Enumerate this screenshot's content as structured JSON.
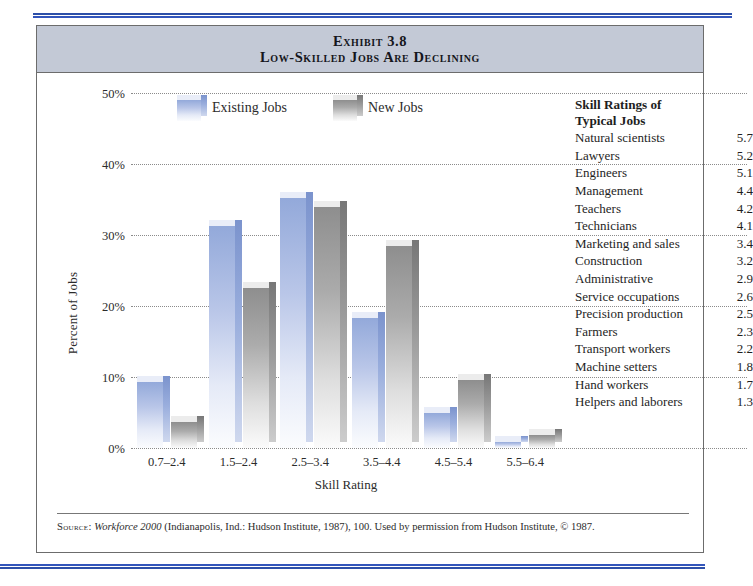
{
  "exhibit": {
    "title_line1": "Exhibit 3.8",
    "title_line2": "Low-Skilled Jobs Are Declining",
    "source_prefix": "Source:",
    "source_italic": "Workforce 2000",
    "source_rest": "(Indianapolis, Ind.: Hudson Institute, 1987), 100. Used by permission from Hudson Institute, © 1987."
  },
  "legend": {
    "existing_label": "Existing Jobs",
    "new_label": "New Jobs",
    "existing_color": "#9aaedd",
    "new_color": "#9a9a9a"
  },
  "ratings": {
    "heading_line1": "Skill Ratings of",
    "heading_line2": "Typical Jobs",
    "rows": [
      {
        "job": "Natural scientists",
        "rating": "5.7"
      },
      {
        "job": "Lawyers",
        "rating": "5.2"
      },
      {
        "job": "Engineers",
        "rating": "5.1"
      },
      {
        "job": "Management",
        "rating": "4.4"
      },
      {
        "job": "Teachers",
        "rating": "4.2"
      },
      {
        "job": "Technicians",
        "rating": "4.1"
      },
      {
        "job": "Marketing and sales",
        "rating": "3.4"
      },
      {
        "job": "Construction",
        "rating": "3.2"
      },
      {
        "job": "Administrative",
        "rating": "2.9"
      },
      {
        "job": "Service occupations",
        "rating": "2.6"
      },
      {
        "job": "Precision production",
        "rating": "2.5"
      },
      {
        "job": "Farmers",
        "rating": "2.3"
      },
      {
        "job": "Transport workers",
        "rating": "2.2"
      },
      {
        "job": "Machine setters",
        "rating": "1.8"
      },
      {
        "job": "Hand workers",
        "rating": "1.7"
      },
      {
        "job": "Helpers and laborers",
        "rating": "1.3"
      }
    ]
  },
  "chart_data": {
    "type": "bar",
    "title": "Low-Skilled Jobs Are Declining",
    "xlabel": "Skill Rating",
    "ylabel": "Percent of Jobs",
    "categories": [
      "0.7–2.4",
      "1.5–2.4",
      "2.5–3.4",
      "3.5–4.4",
      "4.5–5.4",
      "5.5–6.4"
    ],
    "series": [
      {
        "name": "Existing Jobs",
        "values": [
          9.3,
          31.2,
          35.2,
          18.3,
          4.9,
          0.8
        ]
      },
      {
        "name": "New Jobs",
        "values": [
          3.7,
          22.6,
          34.0,
          28.4,
          9.6,
          1.8
        ]
      }
    ],
    "ylim": [
      0,
      50
    ],
    "yticks": [
      "0%",
      "10%",
      "20%",
      "30%",
      "40%",
      "50%"
    ],
    "ytick_values": [
      0,
      10,
      20,
      30,
      40,
      50
    ],
    "grid": true,
    "legend_position": "top-left-inside"
  }
}
